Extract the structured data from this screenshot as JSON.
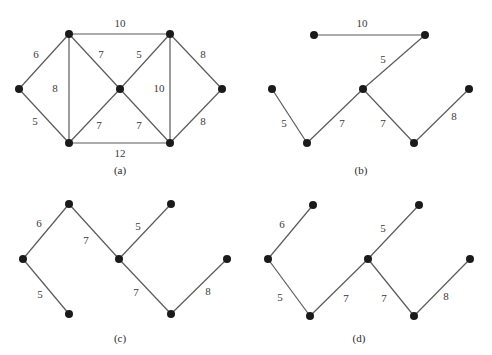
{
  "figure": {
    "colors": {
      "edge": "#5a5a5a",
      "node": "#1a1a1a",
      "text": "#3a3a3a"
    },
    "panels": [
      {
        "id": "a",
        "caption": "(a)",
        "caption_pos": [
          120,
          171
        ],
        "nodes": [
          {
            "id": "L",
            "x": 19,
            "y": 89
          },
          {
            "id": "TL",
            "x": 69,
            "y": 34
          },
          {
            "id": "BL",
            "x": 69,
            "y": 143
          },
          {
            "id": "C",
            "x": 120,
            "y": 89
          },
          {
            "id": "TR",
            "x": 170,
            "y": 34
          },
          {
            "id": "BR",
            "x": 170,
            "y": 143
          },
          {
            "id": "R",
            "x": 222,
            "y": 89
          }
        ],
        "edges": [
          {
            "from": "L",
            "to": "TL",
            "weight": "6",
            "lx": 36,
            "ly": 55
          },
          {
            "from": "L",
            "to": "BL",
            "weight": "5",
            "lx": 35,
            "ly": 122
          },
          {
            "from": "TL",
            "to": "BL",
            "weight": "8",
            "lx": 55,
            "ly": 89
          },
          {
            "from": "TL",
            "to": "TR",
            "weight": "10",
            "lx": 120,
            "ly": 24
          },
          {
            "from": "TL",
            "to": "C",
            "weight": "7",
            "lx": 101,
            "ly": 55
          },
          {
            "from": "BL",
            "to": "C",
            "weight": "7",
            "lx": 99,
            "ly": 126
          },
          {
            "from": "BL",
            "to": "BR",
            "weight": "12",
            "lx": 120,
            "ly": 154
          },
          {
            "from": "C",
            "to": "TR",
            "weight": "5",
            "lx": 139,
            "ly": 55
          },
          {
            "from": "C",
            "to": "BR",
            "weight": "7",
            "lx": 139,
            "ly": 126
          },
          {
            "from": "TR",
            "to": "BR",
            "weight": "10",
            "lx": 159,
            "ly": 89
          },
          {
            "from": "TR",
            "to": "R",
            "weight": "8",
            "lx": 203,
            "ly": 55
          },
          {
            "from": "BR",
            "to": "R",
            "weight": "8",
            "lx": 203,
            "ly": 122
          }
        ]
      },
      {
        "id": "b",
        "caption": "(b)",
        "caption_pos": [
          361,
          171
        ],
        "nodes": [
          {
            "id": "TL",
            "x": 314,
            "y": 35
          },
          {
            "id": "TR",
            "x": 425,
            "y": 35
          },
          {
            "id": "L",
            "x": 272,
            "y": 89
          },
          {
            "id": "C",
            "x": 363,
            "y": 89
          },
          {
            "id": "R",
            "x": 469,
            "y": 89
          },
          {
            "id": "BL",
            "x": 307,
            "y": 143
          },
          {
            "id": "BR",
            "x": 414,
            "y": 143
          }
        ],
        "edges": [
          {
            "from": "TL",
            "to": "TR",
            "weight": "10",
            "lx": 362,
            "ly": 24
          },
          {
            "from": "C",
            "to": "TR",
            "weight": "5",
            "lx": 383,
            "ly": 60
          },
          {
            "from": "L",
            "to": "BL",
            "weight": "5",
            "lx": 284,
            "ly": 124
          },
          {
            "from": "BL",
            "to": "C",
            "weight": "7",
            "lx": 342,
            "ly": 124
          },
          {
            "from": "C",
            "to": "BR",
            "weight": "7",
            "lx": 383,
            "ly": 124
          },
          {
            "from": "BR",
            "to": "R",
            "weight": "8",
            "lx": 454,
            "ly": 117
          }
        ]
      },
      {
        "id": "c",
        "caption": "(c)",
        "caption_pos": [
          120,
          339
        ],
        "nodes": [
          {
            "id": "T",
            "x": 69,
            "y": 204
          },
          {
            "id": "TR",
            "x": 171,
            "y": 204
          },
          {
            "id": "L",
            "x": 23,
            "y": 259
          },
          {
            "id": "C",
            "x": 119,
            "y": 259
          },
          {
            "id": "R",
            "x": 227,
            "y": 259
          },
          {
            "id": "BL",
            "x": 69,
            "y": 314
          },
          {
            "id": "BR",
            "x": 171,
            "y": 314
          }
        ],
        "edges": [
          {
            "from": "L",
            "to": "T",
            "weight": "6",
            "lx": 39,
            "ly": 224
          },
          {
            "from": "T",
            "to": "C",
            "weight": "7",
            "lx": 86,
            "ly": 241
          },
          {
            "from": "C",
            "to": "TR",
            "weight": "5",
            "lx": 138,
            "ly": 227
          },
          {
            "from": "L",
            "to": "BL",
            "weight": "5",
            "lx": 40,
            "ly": 295
          },
          {
            "from": "C",
            "to": "BR",
            "weight": "7",
            "lx": 136,
            "ly": 293
          },
          {
            "from": "BR",
            "to": "R",
            "weight": "8",
            "lx": 208,
            "ly": 292
          }
        ]
      },
      {
        "id": "d",
        "caption": "(d)",
        "caption_pos": [
          359,
          339
        ],
        "nodes": [
          {
            "id": "TL",
            "x": 313,
            "y": 205
          },
          {
            "id": "TR",
            "x": 419,
            "y": 205
          },
          {
            "id": "L",
            "x": 268,
            "y": 259
          },
          {
            "id": "C",
            "x": 368,
            "y": 259
          },
          {
            "id": "R",
            "x": 470,
            "y": 259
          },
          {
            "id": "BL",
            "x": 310,
            "y": 316
          },
          {
            "id": "BR",
            "x": 414,
            "y": 316
          }
        ],
        "edges": [
          {
            "from": "L",
            "to": "TL",
            "weight": "6",
            "lx": 282,
            "ly": 225
          },
          {
            "from": "C",
            "to": "TR",
            "weight": "5",
            "lx": 383,
            "ly": 229
          },
          {
            "from": "L",
            "to": "BL",
            "weight": "5",
            "lx": 280,
            "ly": 298
          },
          {
            "from": "BL",
            "to": "C",
            "weight": "7",
            "lx": 346,
            "ly": 299
          },
          {
            "from": "C",
            "to": "BR",
            "weight": "7",
            "lx": 384,
            "ly": 299
          },
          {
            "from": "BR",
            "to": "R",
            "weight": "8",
            "lx": 446,
            "ly": 297
          }
        ]
      }
    ]
  }
}
